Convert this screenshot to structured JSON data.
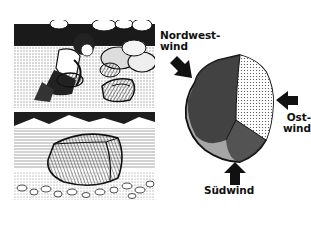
{
  "figure": {
    "panels": [
      {
        "id": "top",
        "description": "Child kneeling among stones examining a wind-polished rock"
      },
      {
        "id": "bottom",
        "description": "Large wind-faceted stone resting on gravel with mountains behind"
      }
    ],
    "diagram": {
      "subject": "Windkanter stone",
      "labels": {
        "northwest": {
          "line1": "Nordwest-",
          "line2": "wind"
        },
        "east": {
          "line1": "Ost-",
          "line2": "wind"
        },
        "south": "Südwind"
      },
      "arrows": [
        {
          "name": "northwest-wind-arrow",
          "direction": "southeast"
        },
        {
          "name": "east-wind-arrow",
          "direction": "west"
        },
        {
          "name": "south-wind-arrow",
          "direction": "north"
        }
      ]
    },
    "colors": {
      "ink": "#111111",
      "paper": "#ffffff",
      "midtone": "#777777"
    }
  }
}
